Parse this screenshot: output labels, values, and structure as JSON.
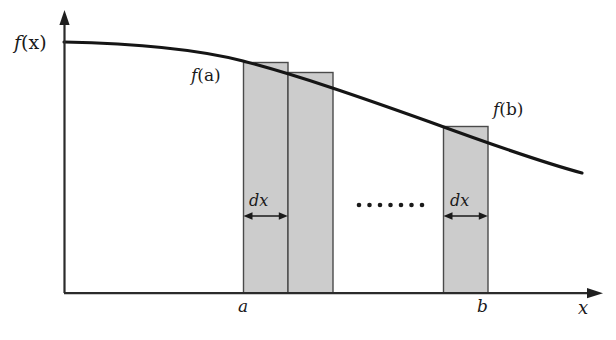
{
  "figure": {
    "colors": {
      "ink": "#1a1a1a",
      "axis": "#2b2b2b",
      "curve": "#151515",
      "bar_fill": "#cccccc",
      "bar_stroke": "#4a4a4a",
      "background": "#ffffff"
    },
    "axes": {
      "y_axis": {
        "name": "vertical-axis",
        "x": 64,
        "y_top": 12,
        "y_bottom": 293,
        "arrow": "up"
      },
      "x_axis": {
        "name": "horizontal-axis",
        "y": 293,
        "x_left": 64,
        "x_right": 602,
        "arrow": "right"
      },
      "x_axis_label": "x"
    },
    "curve": {
      "label": "f(x)",
      "description": "smooth concave-decreasing curve",
      "points": [
        [
          64,
          42
        ],
        [
          110,
          43
        ],
        [
          155,
          46
        ],
        [
          200,
          52
        ],
        [
          243,
          61
        ],
        [
          288,
          72
        ],
        [
          333,
          86
        ],
        [
          378,
          101
        ],
        [
          420,
          117
        ],
        [
          443,
          126
        ],
        [
          465,
          134
        ],
        [
          488,
          143
        ],
        [
          520,
          154
        ],
        [
          550,
          165
        ],
        [
          582,
          173
        ]
      ]
    },
    "labels": {
      "f_of_x": {
        "fn": "f",
        "arg": "(x)"
      },
      "f_of_a": {
        "fn": "f",
        "arg": "(a)"
      },
      "f_of_b": {
        "fn": "f",
        "arg": "(b)"
      },
      "dx_left": {
        "fn": "d",
        "arg": "x"
      },
      "dx_right": {
        "fn": "d",
        "arg": "x"
      },
      "tick_a": "a",
      "tick_b": "b",
      "axis_x": "x"
    },
    "bars": [
      {
        "name": "rect-a-first",
        "x": 243,
        "width": 45,
        "top": 62,
        "bottom": 293
      },
      {
        "name": "rect-a-second",
        "x": 288,
        "width": 45,
        "top": 72,
        "bottom": 293
      },
      {
        "name": "rect-b",
        "x": 443,
        "width": 45,
        "top": 126,
        "bottom": 293
      }
    ],
    "dx_arrows": [
      {
        "name": "dx-arrow-left",
        "x1": 244,
        "x2": 287,
        "y": 216
      },
      {
        "name": "dx-arrow-right",
        "x1": 444,
        "x2": 487,
        "y": 216
      }
    ],
    "ellipsis": {
      "name": "ellipsis-dots",
      "count": 7,
      "y": 205,
      "x_start": 359,
      "x_step": 10.5,
      "radius": 2.3
    },
    "ticks": [
      {
        "name": "tick-a",
        "x": 243,
        "label": "a"
      },
      {
        "name": "tick-b",
        "x": 488,
        "label": "b"
      }
    ]
  }
}
